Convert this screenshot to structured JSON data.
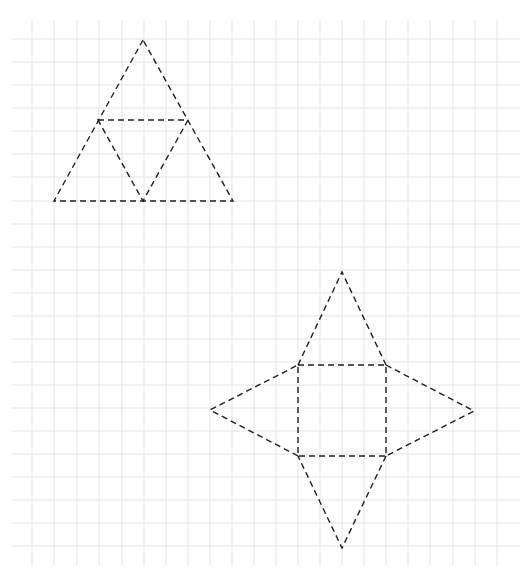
{
  "figure": {
    "background_color": "#ffffff",
    "grid_color": "#e3e3e3",
    "line_color": "#1f1f1f",
    "grid": {
      "x_start": 12,
      "x_end": 520,
      "y_start": 20,
      "y_end": 566,
      "vertical_lines": [
        32,
        54,
        77,
        99,
        122,
        144,
        166,
        188,
        210,
        232,
        254,
        276,
        298,
        320,
        342,
        364,
        386,
        408,
        430,
        453,
        475,
        497
      ],
      "horizontal_lines": [
        39,
        62,
        85,
        108,
        131,
        154,
        177,
        201,
        224,
        247,
        270,
        293,
        316,
        339,
        362,
        385,
        408,
        431,
        454,
        477,
        500,
        523,
        546
      ]
    },
    "nets": [
      {
        "name": "tetrahedron-net",
        "label": "Triangular pyramid net (large triangle subdivided into 4 triangles)",
        "outer_triangle": [
          [
            143,
            40
          ],
          [
            54,
            201
          ],
          [
            233,
            201
          ]
        ],
        "inner_triangle": [
          [
            98,
            120
          ],
          [
            188,
            120
          ],
          [
            143,
            201
          ]
        ]
      },
      {
        "name": "square-pyramid-net",
        "label": "Square pyramid net (square base with 4 triangular faces)",
        "square": [
          [
            298,
            365
          ],
          [
            386,
            365
          ],
          [
            386,
            456
          ],
          [
            298,
            456
          ]
        ],
        "top_apex": [
          342,
          272
        ],
        "right_apex": [
          474,
          411
        ],
        "bottom_apex": [
          342,
          548
        ],
        "left_apex": [
          210,
          410
        ]
      }
    ]
  }
}
